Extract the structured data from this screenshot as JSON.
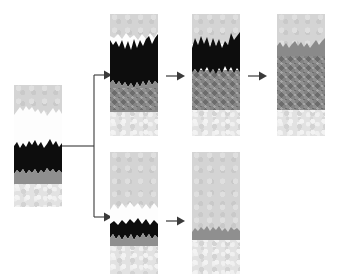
{
  "diagram": {
    "type": "process-flow",
    "background": "#ffffff",
    "palette": {
      "light_gray": "#d2d2d2",
      "white_layer": "#fdfdfd",
      "black_layer": "#0d0d0d",
      "mid_gray": "#999999",
      "dark_mid_gray": "#8a8a8a",
      "stipple_light": "#e2e2e2",
      "line": "#3a3a3a"
    },
    "branch": {
      "label": "split",
      "upper_arrow": "arrow-right",
      "lower_arrow": "arrow-right"
    },
    "panels": [
      {
        "id": "panel-source",
        "name": "source-column",
        "row": "source",
        "step": 0,
        "x": 14,
        "y": 85,
        "w": 48,
        "h": 122,
        "layers": [
          {
            "name": "upper-light-gray",
            "fill": "light_gray",
            "top": 0,
            "height": 26
          },
          {
            "name": "white-band",
            "fill": "white_layer",
            "top": 20,
            "height": 38
          },
          {
            "name": "black-band",
            "fill": "black_layer",
            "top": 44,
            "height": 38
          },
          {
            "name": "mid-gray-band",
            "fill": "mid_gray",
            "top": 79,
            "height": 11
          },
          {
            "name": "basal-stipple",
            "fill": "stipple_light",
            "top": 88,
            "height": 34
          }
        ]
      },
      {
        "id": "panel-upper-1",
        "name": "upper-path-stage-1",
        "row": "upper",
        "step": 1,
        "x": 110,
        "y": 14,
        "w": 48,
        "h": 122,
        "layers": [
          {
            "name": "upper-light-gray",
            "fill": "light_gray",
            "top": 0,
            "height": 28
          },
          {
            "name": "white-remnant",
            "fill": "white_layer",
            "top": 24,
            "height": 14
          },
          {
            "name": "black-band",
            "fill": "black_layer",
            "top": 26,
            "height": 44
          },
          {
            "name": "mid-gray-mass",
            "fill": "dark_mid_gray",
            "top": 66,
            "height": 30
          },
          {
            "name": "basal-stipple",
            "fill": "stipple_light",
            "top": 94,
            "height": 28
          }
        ]
      },
      {
        "id": "panel-upper-2",
        "name": "upper-path-stage-2",
        "row": "upper",
        "step": 2,
        "x": 192,
        "y": 14,
        "w": 48,
        "h": 122,
        "layers": [
          {
            "name": "upper-light-gray",
            "fill": "light_gray",
            "top": 0,
            "height": 26
          },
          {
            "name": "black-band",
            "fill": "black_layer",
            "top": 22,
            "height": 38
          },
          {
            "name": "mid-gray-mass",
            "fill": "dark_mid_gray",
            "top": 56,
            "height": 40
          },
          {
            "name": "basal-stipple",
            "fill": "stipple_light",
            "top": 94,
            "height": 28
          }
        ]
      },
      {
        "id": "panel-upper-3",
        "name": "upper-path-final",
        "row": "upper",
        "step": 3,
        "x": 277,
        "y": 14,
        "w": 48,
        "h": 122,
        "layers": [
          {
            "name": "upper-light-gray",
            "fill": "light_gray",
            "top": 0,
            "height": 34
          },
          {
            "name": "mid-gray-mass",
            "fill": "dark_mid_gray",
            "top": 28,
            "height": 68
          },
          {
            "name": "basal-stipple",
            "fill": "stipple_light",
            "top": 94,
            "height": 28
          }
        ]
      },
      {
        "id": "panel-lower-1",
        "name": "lower-path-stage-1",
        "row": "lower",
        "step": 1,
        "x": 110,
        "y": 152,
        "w": 48,
        "h": 122,
        "layers": [
          {
            "name": "upper-light-gray",
            "fill": "light_gray",
            "top": 0,
            "height": 56
          },
          {
            "name": "white-band",
            "fill": "white_layer",
            "top": 50,
            "height": 24
          },
          {
            "name": "black-band",
            "fill": "black_layer",
            "top": 60,
            "height": 26
          },
          {
            "name": "mid-gray-band",
            "fill": "mid_gray",
            "top": 82,
            "height": 10
          },
          {
            "name": "basal-stipple",
            "fill": "stipple_light",
            "top": 90,
            "height": 32
          }
        ]
      },
      {
        "id": "panel-lower-2",
        "name": "lower-path-final",
        "row": "lower",
        "step": 2,
        "x": 192,
        "y": 152,
        "w": 48,
        "h": 122,
        "layers": [
          {
            "name": "upper-light-gray",
            "fill": "light_gray",
            "top": 0,
            "height": 80
          },
          {
            "name": "mid-gray-band",
            "fill": "mid_gray",
            "top": 74,
            "height": 12
          },
          {
            "name": "basal-stipple",
            "fill": "stipple_light",
            "top": 84,
            "height": 38
          }
        ]
      }
    ],
    "connectors": [
      {
        "name": "branch-connector",
        "from": "panel-source",
        "to": [
          "panel-upper-1",
          "panel-lower-1"
        ],
        "style": "elbow-split"
      },
      {
        "name": "arrow-upper-1-2",
        "from": "panel-upper-1",
        "to": "panel-upper-2",
        "style": "straight"
      },
      {
        "name": "arrow-upper-2-3",
        "from": "panel-upper-2",
        "to": "panel-upper-3",
        "style": "straight"
      },
      {
        "name": "arrow-lower-1-2",
        "from": "panel-lower-1",
        "to": "panel-lower-2",
        "style": "straight"
      }
    ]
  }
}
